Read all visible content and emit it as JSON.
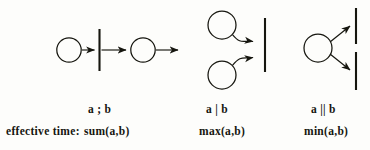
{
  "figure": {
    "kind": "petri-net-composition-operators",
    "background_color": "#fdfdfb",
    "ink_color": "#16160f",
    "row_label": "effective time:",
    "columns": [
      {
        "id": "sequential",
        "operator_label": "a ; b",
        "effective_time_label": "sum(a,b)",
        "diagram": {
          "type": "sequence",
          "places": 2,
          "transitions": 1,
          "description": "place arrow transition-bar arrow place arrow"
        }
      },
      {
        "id": "choice-join",
        "operator_label": "a | b",
        "effective_time_label": "max(a,b)",
        "diagram": {
          "type": "join",
          "places": 2,
          "transitions": 1,
          "description": "two places curve into one transition bar"
        }
      },
      {
        "id": "parallel-fork",
        "operator_label": "a || b",
        "effective_time_label": "min(a,b)",
        "diagram": {
          "type": "fork",
          "places": 1,
          "transitions": 2,
          "description": "one place fans out to two transition bars"
        }
      }
    ]
  }
}
